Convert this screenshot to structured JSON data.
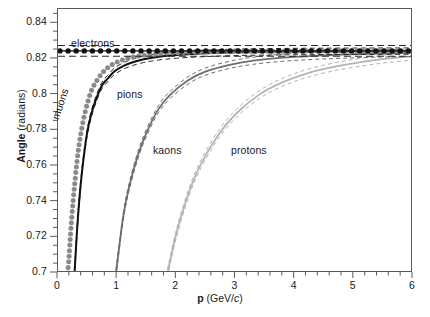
{
  "figure": {
    "kind": "scientific-plot",
    "background": "#ffffff"
  },
  "axes": {
    "x": {
      "label_bold": "p",
      "label_rest": " (GeV/",
      "label_italic": "c",
      "label_close": ")",
      "label_full": "p (GeV/c)",
      "min": 0,
      "max": 6,
      "major_ticks": [
        0,
        1,
        2,
        3,
        4,
        5,
        6
      ],
      "tick_labels": [
        "0",
        "1",
        "2",
        "3",
        "4",
        "5",
        "6"
      ],
      "minor_per_major": 5
    },
    "y": {
      "label_bold": "Angle",
      "label_rest": " (radians)",
      "label_full": "Angle (radians)",
      "min": 0.7,
      "max": 0.848,
      "major_ticks": [
        0.7,
        0.72,
        0.74,
        0.76,
        0.78,
        0.8,
        0.82,
        0.84
      ],
      "tick_labels": [
        "0.7",
        "0.72",
        "0.74",
        "0.76",
        "0.78",
        "0.8",
        "0.82",
        "0.84"
      ],
      "minor_per_major": 4
    }
  },
  "series_labels": {
    "electrons": "electrons",
    "muons": "muons",
    "pions": "pions",
    "kaons": "kaons",
    "protons": "protons"
  },
  "colors": {
    "electrons": "#111111",
    "muons": "#8a8a8a",
    "pions": "#111111",
    "kaons": "#6e6e6e",
    "protons": "#b4b4b4",
    "frame": "#5a5a5a",
    "text": "#1a1a1a"
  },
  "chart_data": {
    "type": "line",
    "title": "",
    "xlabel": "p (GeV/c)",
    "ylabel": "Angle (radians)",
    "xlim": [
      0,
      6
    ],
    "ylim": [
      0.7,
      0.848
    ],
    "grid": false,
    "legend": "in-plot annotations",
    "saturation_angle": 0.8245,
    "refractive_index": 1.0014,
    "series": [
      {
        "name": "electrons",
        "style": "dotted-markers",
        "color": "#111111",
        "mass_GeV": 0.000511,
        "x": [
          0.15,
          0.3,
          0.5,
          0.75,
          1.0,
          1.25,
          1.5,
          2.0,
          2.5,
          3.0,
          3.5,
          4.0,
          4.5,
          5.0,
          5.5,
          6.0
        ],
        "values": [
          0.8245,
          0.8245,
          0.8245,
          0.8245,
          0.8245,
          0.8245,
          0.8245,
          0.8245,
          0.8245,
          0.8245,
          0.8245,
          0.8245,
          0.8245,
          0.8245,
          0.8245,
          0.8245
        ],
        "band_upper": 0.8275,
        "band_lower": 0.8215
      },
      {
        "name": "muons",
        "style": "dotted-markers",
        "color": "#8a8a8a",
        "mass_GeV": 0.1057,
        "x": [
          0.16,
          0.18,
          0.2,
          0.23,
          0.26,
          0.3,
          0.34,
          0.38,
          0.43,
          0.48,
          0.55,
          0.62,
          0.7,
          0.8,
          0.92,
          1.05,
          1.2,
          1.4,
          1.7,
          2.0,
          2.5,
          3.0,
          4.0,
          5.0,
          6.0
        ],
        "values": [
          0.7,
          0.706,
          0.716,
          0.73,
          0.742,
          0.756,
          0.768,
          0.777,
          0.786,
          0.793,
          0.801,
          0.806,
          0.81,
          0.814,
          0.817,
          0.819,
          0.8205,
          0.8218,
          0.823,
          0.8235,
          0.824,
          0.8242,
          0.8244,
          0.8244,
          0.8245
        ]
      },
      {
        "name": "pions",
        "style": "solid-with-dashed-bands",
        "color": "#111111",
        "mass_GeV": 0.1396,
        "x": [
          0.28,
          0.32,
          0.36,
          0.4,
          0.45,
          0.5,
          0.57,
          0.65,
          0.74,
          0.84,
          0.95,
          1.1,
          1.25,
          1.45,
          1.7,
          2.0,
          2.4,
          3.0,
          3.6,
          4.2,
          5.0,
          6.0
        ],
        "values": [
          0.7,
          0.723,
          0.741,
          0.755,
          0.769,
          0.78,
          0.79,
          0.798,
          0.805,
          0.809,
          0.813,
          0.816,
          0.818,
          0.8198,
          0.8212,
          0.8222,
          0.823,
          0.8237,
          0.824,
          0.8242,
          0.8243,
          0.8244
        ]
      },
      {
        "name": "kaons",
        "style": "solid-with-dashed-bands",
        "color": "#6e6e6e",
        "mass_GeV": 0.4937,
        "x": [
          0.98,
          1.1,
          1.2,
          1.35,
          1.5,
          1.7,
          1.9,
          2.2,
          2.5,
          2.9,
          3.3,
          3.8,
          4.3,
          4.8,
          5.4,
          6.0
        ],
        "values": [
          0.7,
          0.731,
          0.748,
          0.766,
          0.779,
          0.792,
          0.8,
          0.808,
          0.813,
          0.8167,
          0.819,
          0.8207,
          0.8217,
          0.8224,
          0.823,
          0.8234
        ]
      },
      {
        "name": "protons",
        "style": "solid-with-dashed-bands",
        "color": "#b4b4b4",
        "mass_GeV": 0.9383,
        "x": [
          1.85,
          2.0,
          2.2,
          2.4,
          2.7,
          3.0,
          3.4,
          3.8,
          4.2,
          4.7,
          5.2,
          5.6,
          6.0
        ],
        "values": [
          0.7,
          0.722,
          0.744,
          0.76,
          0.777,
          0.789,
          0.8,
          0.807,
          0.8118,
          0.8158,
          0.8186,
          0.8203,
          0.8216
        ]
      }
    ]
  }
}
